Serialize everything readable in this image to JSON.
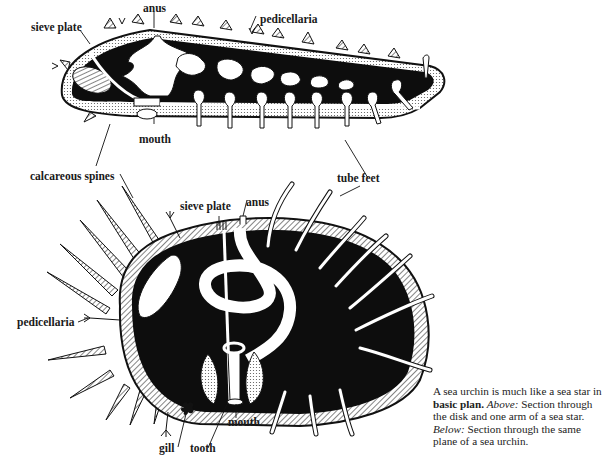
{
  "diagram": {
    "sea_star_labels": {
      "sieve_plate": "sieve plate",
      "anus": "anus",
      "pedicellaria": "pedicellaria",
      "mouth": "mouth",
      "calcareous_spines": "calcareous spines",
      "tube_feet": "tube feet"
    },
    "sea_urchin_labels": {
      "sieve_plate": "sieve plate",
      "anus": "anus",
      "pedicellaria": "pedicellaria",
      "gill": "gill",
      "tooth": "tooth",
      "mouth": "mouth"
    },
    "colors": {
      "ink": "#111111",
      "paper": "#ffffff",
      "hatch": "#9a9a9a"
    }
  },
  "caption": {
    "part1": "A sea urchin is much like a sea star in ",
    "bold": "basic plan.",
    "part2": " ",
    "italic1": "Above:",
    "part3": " Section through the disk and one arm of a sea star. ",
    "italic2": "Below:",
    "part4": " Section through the same plane of a sea urchin."
  }
}
